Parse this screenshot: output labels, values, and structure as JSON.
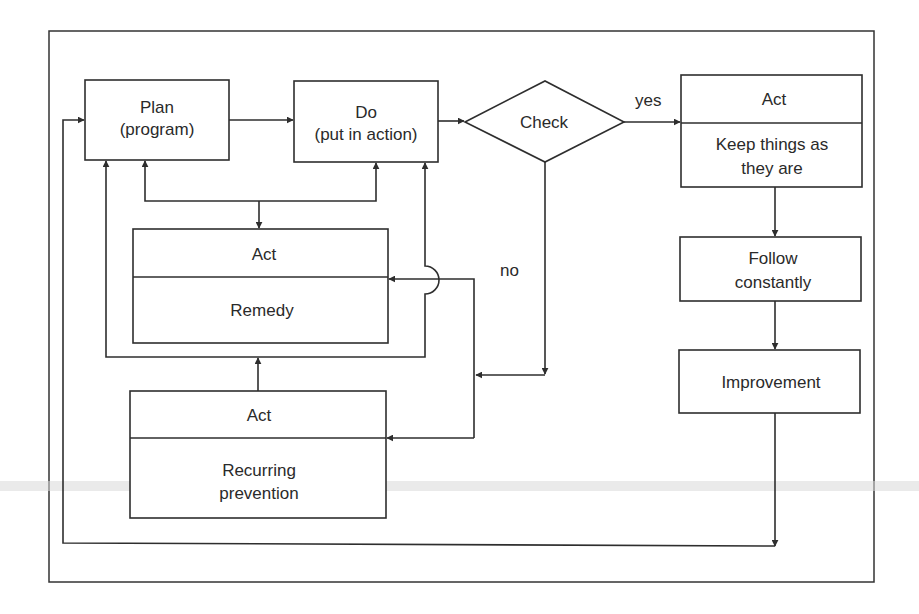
{
  "diagram": {
    "nodes": {
      "plan": {
        "line1": "Plan",
        "line2": "(program)"
      },
      "do": {
        "line1": "Do",
        "line2": "(put in action)"
      },
      "check": {
        "label": "Check"
      },
      "act_keep": {
        "header": "Act",
        "line1": "Keep things as",
        "line2": "they are"
      },
      "follow": {
        "line1": "Follow",
        "line2": "constantly"
      },
      "improvement": {
        "label": "Improvement"
      },
      "act_remedy": {
        "header": "Act",
        "body": "Remedy"
      },
      "act_recurring": {
        "header": "Act",
        "line1": "Recurring",
        "line2": "prevention"
      }
    },
    "edges": {
      "yes_label": "yes",
      "no_label": "no"
    },
    "colors": {
      "stroke": "#2e2e2e",
      "background": "#ffffff",
      "text": "#2a2a2a"
    }
  }
}
